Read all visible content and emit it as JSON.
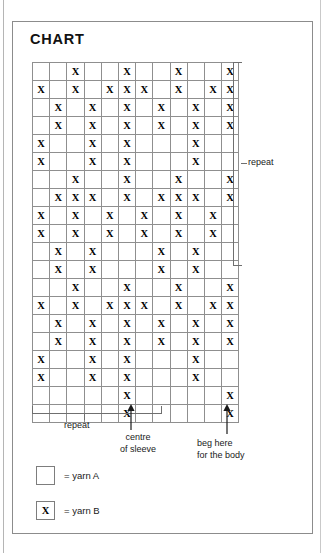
{
  "page": {
    "title": "CHART"
  },
  "annotations": {
    "repeat_vertical": "repeat",
    "repeat_horizontal": "repeat",
    "centre_of_sleeve_line1": "centre",
    "centre_of_sleeve_line2": "of sleeve",
    "beg_here_line1": "beg here",
    "beg_here_line2": "for the body"
  },
  "legend": {
    "items": [
      {
        "symbol": "",
        "label": "= yarn A",
        "name": "yarn-a"
      },
      {
        "symbol": "X",
        "label": "= yarn B",
        "name": "yarn-b"
      }
    ]
  },
  "chart_data": {
    "type": "heatmap",
    "title": "CHART",
    "xlabel": "",
    "ylabel": "",
    "columns": 12,
    "rows": 20,
    "symbol_on": "X",
    "symbol_off": "",
    "legend_entries": [
      "= yarn A",
      "= yarn B"
    ],
    "legend_position": "bottom-left",
    "grid": true,
    "annotations": [
      {
        "text": "repeat",
        "orientation": "vertical",
        "side": "right",
        "span_rows": [
          1,
          12
        ]
      },
      {
        "text": "repeat",
        "orientation": "horizontal",
        "side": "bottom",
        "span_columns": [
          1,
          8
        ]
      },
      {
        "text": "centre of sleeve",
        "orientation": "arrow-up",
        "side": "bottom",
        "at_column": 6
      },
      {
        "text": "beg here for the body",
        "orientation": "arrow-up",
        "side": "bottom",
        "at_column": 12
      }
    ],
    "cells": [
      [
        0,
        0,
        1,
        0,
        0,
        1,
        0,
        0,
        1,
        0,
        0,
        1
      ],
      [
        1,
        0,
        1,
        0,
        1,
        1,
        1,
        0,
        1,
        0,
        1,
        1
      ],
      [
        0,
        1,
        0,
        1,
        0,
        1,
        0,
        1,
        0,
        1,
        0,
        1
      ],
      [
        0,
        1,
        0,
        1,
        0,
        1,
        0,
        1,
        0,
        1,
        0,
        1
      ],
      [
        1,
        0,
        0,
        1,
        0,
        1,
        0,
        0,
        0,
        1,
        0,
        0
      ],
      [
        1,
        0,
        0,
        1,
        0,
        1,
        0,
        0,
        0,
        1,
        0,
        0
      ],
      [
        0,
        0,
        1,
        0,
        0,
        1,
        0,
        0,
        1,
        0,
        0,
        1
      ],
      [
        0,
        1,
        1,
        1,
        0,
        1,
        0,
        1,
        1,
        1,
        0,
        1
      ],
      [
        1,
        0,
        1,
        0,
        1,
        0,
        1,
        0,
        1,
        0,
        1,
        0
      ],
      [
        1,
        0,
        1,
        0,
        1,
        0,
        1,
        0,
        1,
        0,
        1,
        0
      ],
      [
        0,
        1,
        0,
        1,
        0,
        0,
        0,
        1,
        0,
        1,
        0,
        0
      ],
      [
        0,
        1,
        0,
        1,
        0,
        0,
        0,
        1,
        0,
        1,
        0,
        0
      ],
      [
        0,
        0,
        1,
        0,
        0,
        1,
        0,
        0,
        1,
        0,
        0,
        1
      ],
      [
        1,
        0,
        1,
        0,
        1,
        1,
        1,
        0,
        1,
        0,
        1,
        1
      ],
      [
        0,
        1,
        0,
        1,
        0,
        1,
        0,
        1,
        0,
        1,
        0,
        1
      ],
      [
        0,
        1,
        0,
        1,
        0,
        1,
        0,
        1,
        0,
        1,
        0,
        1
      ],
      [
        1,
        0,
        0,
        1,
        0,
        1,
        0,
        0,
        0,
        1,
        0,
        0
      ],
      [
        1,
        0,
        0,
        1,
        0,
        1,
        0,
        0,
        0,
        1,
        0,
        0
      ],
      [
        0,
        0,
        0,
        0,
        0,
        1,
        0,
        0,
        0,
        0,
        0,
        1
      ],
      [
        0,
        0,
        0,
        0,
        0,
        1,
        0,
        0,
        0,
        0,
        0,
        1
      ]
    ]
  }
}
